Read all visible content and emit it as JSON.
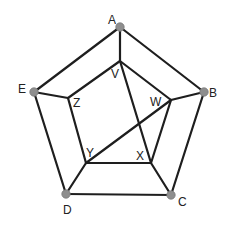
{
  "diagram": {
    "type": "graph",
    "colors": {
      "edge": "#1e1e1e",
      "node_fill": "#8e8e8e",
      "label": "#222222",
      "background": "#ffffff"
    },
    "outer_vertices": [
      {
        "id": "A",
        "label": "A",
        "x": 120,
        "y": 27,
        "lx": 108,
        "ly": 24,
        "dot": true
      },
      {
        "id": "B",
        "label": "B",
        "x": 204,
        "y": 92,
        "lx": 209,
        "ly": 97,
        "dot": true
      },
      {
        "id": "C",
        "label": "C",
        "x": 171,
        "y": 195,
        "lx": 178,
        "ly": 206,
        "dot": true
      },
      {
        "id": "D",
        "label": "D",
        "x": 66,
        "y": 194,
        "lx": 63,
        "ly": 214,
        "dot": true
      },
      {
        "id": "E",
        "label": "E",
        "x": 34,
        "y": 92,
        "lx": 18,
        "ly": 93,
        "dot": true
      }
    ],
    "inner_vertices": [
      {
        "id": "V",
        "label": "V",
        "x": 120,
        "y": 61,
        "lx": 111,
        "ly": 78,
        "dot": false
      },
      {
        "id": "W",
        "label": "W",
        "x": 171,
        "y": 100,
        "lx": 150,
        "ly": 106,
        "dot": false
      },
      {
        "id": "X",
        "label": "X",
        "x": 151,
        "y": 163,
        "lx": 136,
        "ly": 160,
        "dot": false
      },
      {
        "id": "Y",
        "label": "Y",
        "x": 86,
        "y": 163,
        "lx": 86,
        "ly": 157,
        "dot": false
      },
      {
        "id": "Z",
        "label": "Z",
        "x": 68,
        "y": 98,
        "lx": 73,
        "ly": 107,
        "dot": false
      }
    ],
    "edges": [
      [
        "A",
        "B"
      ],
      [
        "B",
        "C"
      ],
      [
        "C",
        "D"
      ],
      [
        "D",
        "E"
      ],
      [
        "E",
        "A"
      ],
      [
        "A",
        "V"
      ],
      [
        "B",
        "W"
      ],
      [
        "C",
        "X"
      ],
      [
        "D",
        "Y"
      ],
      [
        "E",
        "Z"
      ],
      [
        "V",
        "W"
      ],
      [
        "W",
        "X"
      ],
      [
        "X",
        "Y"
      ],
      [
        "Y",
        "Z"
      ],
      [
        "Z",
        "V"
      ],
      [
        "V",
        "X"
      ],
      [
        "W",
        "Y"
      ]
    ]
  }
}
